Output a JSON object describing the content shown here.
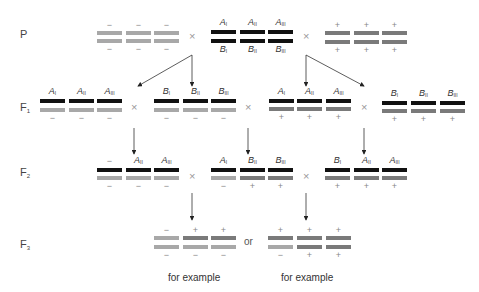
{
  "generations": {
    "P": "P",
    "F1": "F",
    "F1_sub": "1",
    "F2": "F",
    "F2_sub": "2",
    "F3": "F",
    "F3_sub": "3"
  },
  "symbols": {
    "cross": "×",
    "minus": "−",
    "plus": "+",
    "or": "or"
  },
  "captions": {
    "left": "for example",
    "right": "for example"
  },
  "colors": {
    "black_chromosome": "#111111",
    "gray_chromosome": "#a8a8a8",
    "dark_gray_chromosome": "#7a7a7a",
    "arrow": "#333333"
  },
  "rows": {
    "P": {
      "left_parent": [
        {
          "top": "−",
          "bottom": "−",
          "top_bar": "gray",
          "bottom_bar": "gray"
        },
        {
          "top": "−",
          "bottom": "−",
          "top_bar": "gray",
          "bottom_bar": "gray"
        },
        {
          "top": "−",
          "bottom": "−",
          "top_bar": "gray",
          "bottom_bar": "gray"
        }
      ],
      "middle_parent": [
        {
          "top": "A",
          "top_sub": "I",
          "bottom": "B",
          "bottom_sub": "I"
        },
        {
          "top": "A",
          "top_sub": "II",
          "bottom": "B",
          "bottom_sub": "II"
        },
        {
          "top": "A",
          "top_sub": "III",
          "bottom": "B",
          "bottom_sub": "III"
        }
      ],
      "right_parent": [
        {
          "top": "+",
          "bottom": "+"
        },
        {
          "top": "+",
          "bottom": "+"
        },
        {
          "top": "+",
          "bottom": "+"
        }
      ]
    },
    "F1": {
      "groups": [
        {
          "labels": [
            [
              "A",
              "I"
            ],
            [
              "A",
              "II"
            ],
            [
              "A",
              "III"
            ]
          ],
          "signs": [
            "−",
            "−",
            "−"
          ]
        },
        {
          "labels": [
            [
              "B",
              "I"
            ],
            [
              "B",
              "II"
            ],
            [
              "B",
              "III"
            ]
          ],
          "signs": [
            "−",
            "−",
            "−"
          ]
        },
        {
          "labels": [
            [
              "A",
              "I"
            ],
            [
              "A",
              "II"
            ],
            [
              "A",
              "III"
            ]
          ],
          "signs": [
            "+",
            "+",
            "+"
          ]
        },
        {
          "labels": [
            [
              "B",
              "I"
            ],
            [
              "B",
              "II"
            ],
            [
              "B",
              "III"
            ]
          ],
          "signs": [
            "+",
            "+",
            "+"
          ]
        }
      ]
    },
    "F2": {
      "groups": [
        {
          "labels": [
            [
              "−",
              ""
            ],
            [
              "A",
              "II"
            ],
            [
              "A",
              "III"
            ]
          ],
          "signs": [
            "−",
            "−",
            "−"
          ]
        },
        {
          "labels": [
            [
              "A",
              "I"
            ],
            [
              "B",
              "II"
            ],
            [
              "B",
              "III"
            ]
          ],
          "signs": [
            "−",
            "+",
            "+"
          ]
        },
        {
          "labels": [
            [
              "B",
              "I"
            ],
            [
              "A",
              "II"
            ],
            [
              "A",
              "III"
            ]
          ],
          "signs": [
            "+",
            "+",
            "+"
          ]
        }
      ]
    },
    "F3": {
      "left": {
        "top": [
          "−",
          "+",
          "+"
        ],
        "bottom": [
          "−",
          "−",
          "−"
        ]
      },
      "right": {
        "top": [
          "+",
          "+",
          "+"
        ],
        "bottom": [
          "−",
          "+",
          "+"
        ]
      }
    }
  }
}
